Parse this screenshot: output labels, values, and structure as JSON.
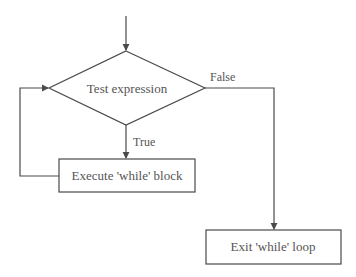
{
  "diagram": {
    "type": "flowchart",
    "colors": {
      "stroke": "#4a4a4a",
      "text": "#555555",
      "background": "#ffffff"
    },
    "nodes": {
      "decision": {
        "label": "Test expression",
        "shape": "diamond"
      },
      "body": {
        "label": "Execute 'while' block",
        "shape": "rectangle"
      },
      "exit": {
        "label": "Exit 'while' loop",
        "shape": "rectangle"
      }
    },
    "edges": {
      "true_label": "True",
      "false_label": "False"
    }
  }
}
